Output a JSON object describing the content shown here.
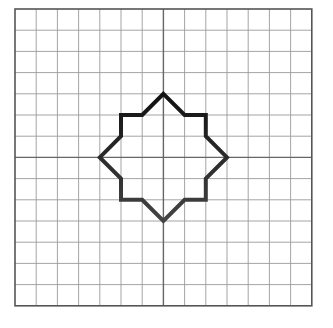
{
  "diagram": {
    "type": "grid-with-polygon",
    "background": "#ffffff",
    "grid": {
      "origin_px": [
        15,
        9
      ],
      "cells": 14,
      "cell_px": 21.2,
      "line_color": "#9a9a9a",
      "border_color": "#555555",
      "axis_color": "#666666",
      "center_cell": [
        7,
        7
      ]
    },
    "shape": {
      "name": "eight-pointed star",
      "vertices_grid_units_from_center": [
        [
          0,
          -3
        ],
        [
          1,
          -2
        ],
        [
          2,
          -2
        ],
        [
          2,
          -1
        ],
        [
          3,
          0
        ],
        [
          2,
          1
        ],
        [
          2,
          2
        ],
        [
          1,
          2
        ],
        [
          0,
          3
        ],
        [
          -1,
          2
        ],
        [
          -2,
          2
        ],
        [
          -2,
          1
        ],
        [
          -3,
          0
        ],
        [
          -2,
          -1
        ],
        [
          -2,
          -2
        ],
        [
          -1,
          -2
        ]
      ],
      "stroke_top": "#111111",
      "stroke_bottom": "#444444",
      "stroke_width": 4
    }
  }
}
